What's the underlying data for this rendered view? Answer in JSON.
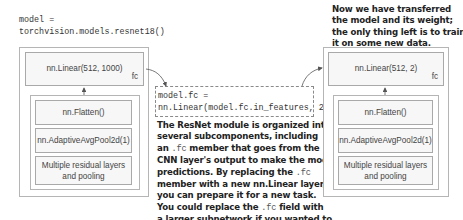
{
  "left_model": {
    "code_line1": "model =",
    "code_line2": "torchvision.models.resnet18()",
    "fc_layer": "nn.Linear(512, 1000)",
    "fc_label": "fc",
    "layers": [
      "nn.Flatten()",
      "nn.AdaptiveAvgPool2d(1)",
      "Multiple residual layers and pooling"
    ]
  },
  "middle": {
    "code_line1": "model.fc =",
    "code_line2": "nn.Linear(model.fc.in_features, 2)",
    "description_lines": [
      "The ResNet module is organized into",
      "several subcomponents, including",
      "an .fc member that goes from the",
      "CNN layer's output to make the model's",
      "predictions. By replacing the .fc",
      "member with a new nn.Linear layer,",
      "you can prepare it for a new task.",
      "You could replace the .fc field with",
      "a larger subnetwork if you wanted to."
    ],
    "desc": {
      "l1": "The ResNet module is organized into",
      "l2": "several subcomponents, including",
      "l3a": "an ",
      "l3code": ".fc",
      "l3b": " member that goes from the",
      "l4": "CNN layer's output to make the model's",
      "l5a": "predictions. By replacing the ",
      "l5code": ".fc",
      "l6": "member with a new nn.Linear layer,",
      "l7": "you can prepare it for a new task.",
      "l8a": "You could replace the ",
      "l8code": ".fc",
      "l8b": " field with",
      "l9": "a larger subnetwork if you wanted to."
    }
  },
  "right_model": {
    "caption_lines": [
      "Now we have transferred",
      "the model and its weight;",
      "the only thing left is to train",
      "it on some new data."
    ],
    "fc_layer": "nn.Linear(512, 2)",
    "fc_label": "fc",
    "layers": [
      "nn.Flatten()",
      "nn.AdaptiveAvgPool2d(1)",
      "Multiple residual layers and pooling"
    ]
  },
  "colors": {
    "box_border": "#b5b5b5",
    "layer_fill": "#f7f7f7",
    "arrow": "#555555",
    "text_bold": "#222222"
  }
}
